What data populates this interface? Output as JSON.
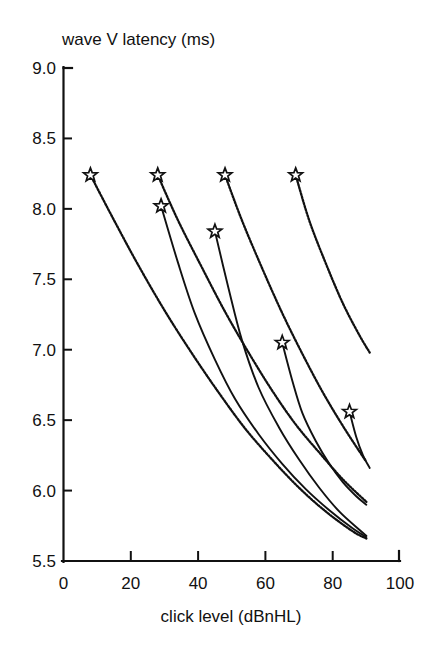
{
  "figure": {
    "title_y": "wave V latency (ms)",
    "title_x": "click level (dBnHL)"
  },
  "axes": {
    "y_ticks": [
      "9.0",
      "8.5",
      "8.0",
      "7.5",
      "7.0",
      "6.5",
      "6.0",
      "5.5"
    ],
    "x_ticks": [
      "0",
      "20",
      "40",
      "60",
      "80",
      "100"
    ]
  },
  "chart_data": {
    "type": "line",
    "title": "",
    "xlabel": "click level (dBnHL)",
    "ylabel": "wave V latency (ms)",
    "xlim": [
      0,
      100
    ],
    "ylim": [
      5.5,
      9.0
    ],
    "xticks": [
      0,
      20,
      40,
      60,
      80,
      100
    ],
    "yticks": [
      5.5,
      6.0,
      6.5,
      7.0,
      7.5,
      8.0,
      8.5,
      9.0
    ],
    "grid": false,
    "legend": "none",
    "marker": "open-star",
    "marker_meaning": "threshold / starting click level for each latency-intensity function",
    "series": [
      {
        "name": "curve-1",
        "style": "dotted",
        "start_marker": {
          "x": 8,
          "y": 8.24
        },
        "points": [
          {
            "x": 8,
            "y": 8.24
          },
          {
            "x": 15,
            "y": 7.92
          },
          {
            "x": 22,
            "y": 7.61
          },
          {
            "x": 30,
            "y": 7.28
          },
          {
            "x": 38,
            "y": 6.98
          },
          {
            "x": 46,
            "y": 6.7
          },
          {
            "x": 54,
            "y": 6.44
          },
          {
            "x": 62,
            "y": 6.22
          },
          {
            "x": 70,
            "y": 6.02
          },
          {
            "x": 78,
            "y": 5.85
          },
          {
            "x": 86,
            "y": 5.71
          },
          {
            "x": 90,
            "y": 5.66
          }
        ]
      },
      {
        "name": "curve-2",
        "style": "solid",
        "start_marker": {
          "x": 29,
          "y": 8.02
        },
        "points": [
          {
            "x": 29,
            "y": 8.02
          },
          {
            "x": 34,
            "y": 7.62
          },
          {
            "x": 39,
            "y": 7.26
          },
          {
            "x": 45,
            "y": 6.93
          },
          {
            "x": 51,
            "y": 6.65
          },
          {
            "x": 58,
            "y": 6.4
          },
          {
            "x": 65,
            "y": 6.19
          },
          {
            "x": 72,
            "y": 6.01
          },
          {
            "x": 79,
            "y": 5.86
          },
          {
            "x": 86,
            "y": 5.73
          },
          {
            "x": 90,
            "y": 5.67
          }
        ]
      },
      {
        "name": "curve-3",
        "style": "dotted",
        "start_marker": {
          "x": 28,
          "y": 8.24
        },
        "points": [
          {
            "x": 28,
            "y": 8.24
          },
          {
            "x": 34,
            "y": 7.92
          },
          {
            "x": 41,
            "y": 7.59
          },
          {
            "x": 48,
            "y": 7.27
          },
          {
            "x": 55,
            "y": 6.98
          },
          {
            "x": 62,
            "y": 6.71
          },
          {
            "x": 69,
            "y": 6.47
          },
          {
            "x": 76,
            "y": 6.27
          },
          {
            "x": 83,
            "y": 6.08
          },
          {
            "x": 90,
            "y": 5.92
          }
        ]
      },
      {
        "name": "curve-4",
        "style": "solid",
        "start_marker": {
          "x": 45,
          "y": 7.84
        },
        "points": [
          {
            "x": 45,
            "y": 7.84
          },
          {
            "x": 49,
            "y": 7.44
          },
          {
            "x": 53,
            "y": 7.07
          },
          {
            "x": 58,
            "y": 6.73
          },
          {
            "x": 64,
            "y": 6.45
          },
          {
            "x": 70,
            "y": 6.22
          },
          {
            "x": 76,
            "y": 6.02
          },
          {
            "x": 82,
            "y": 5.85
          },
          {
            "x": 88,
            "y": 5.72
          },
          {
            "x": 90,
            "y": 5.68
          }
        ]
      },
      {
        "name": "curve-5",
        "style": "dotted",
        "start_marker": {
          "x": 48,
          "y": 8.24
        },
        "points": [
          {
            "x": 48,
            "y": 8.24
          },
          {
            "x": 53,
            "y": 7.92
          },
          {
            "x": 59,
            "y": 7.58
          },
          {
            "x": 65,
            "y": 7.26
          },
          {
            "x": 71,
            "y": 6.97
          },
          {
            "x": 77,
            "y": 6.7
          },
          {
            "x": 83,
            "y": 6.46
          },
          {
            "x": 89,
            "y": 6.24
          },
          {
            "x": 90,
            "y": 6.21
          }
        ]
      },
      {
        "name": "curve-6",
        "style": "solid",
        "start_marker": {
          "x": 65,
          "y": 7.05
        },
        "points": [
          {
            "x": 65,
            "y": 7.05
          },
          {
            "x": 68,
            "y": 6.78
          },
          {
            "x": 71,
            "y": 6.55
          },
          {
            "x": 75,
            "y": 6.35
          },
          {
            "x": 79,
            "y": 6.19
          },
          {
            "x": 83,
            "y": 6.06
          },
          {
            "x": 87,
            "y": 5.96
          },
          {
            "x": 90,
            "y": 5.9
          }
        ]
      },
      {
        "name": "curve-7",
        "style": "dotted",
        "start_marker": {
          "x": 69,
          "y": 8.24
        },
        "points": [
          {
            "x": 69,
            "y": 8.24
          },
          {
            "x": 73,
            "y": 7.92
          },
          {
            "x": 78,
            "y": 7.61
          },
          {
            "x": 83,
            "y": 7.33
          },
          {
            "x": 88,
            "y": 7.1
          },
          {
            "x": 91,
            "y": 6.98
          }
        ]
      },
      {
        "name": "curve-8",
        "style": "solid",
        "start_marker": {
          "x": 85,
          "y": 6.56
        },
        "points": [
          {
            "x": 85,
            "y": 6.56
          },
          {
            "x": 87,
            "y": 6.38
          },
          {
            "x": 89,
            "y": 6.25
          },
          {
            "x": 91,
            "y": 6.16
          }
        ]
      }
    ],
    "markers": [
      {
        "x": 8,
        "y": 8.24
      },
      {
        "x": 28,
        "y": 8.24
      },
      {
        "x": 29,
        "y": 8.02
      },
      {
        "x": 45,
        "y": 7.84
      },
      {
        "x": 48,
        "y": 8.24
      },
      {
        "x": 65,
        "y": 7.05
      },
      {
        "x": 69,
        "y": 8.24
      },
      {
        "x": 85,
        "y": 6.56
      }
    ]
  }
}
